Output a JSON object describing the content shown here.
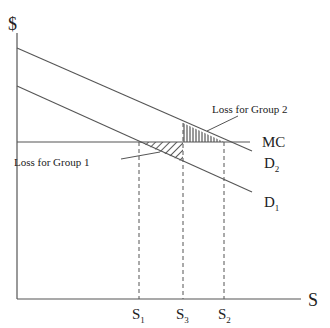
{
  "diagram": {
    "y_axis_label": "$",
    "x_axis_label": "S",
    "curves": {
      "mc_label": "MC",
      "d2_label": "D",
      "d2_sub": "2",
      "d1_label": "D",
      "d1_sub": "1"
    },
    "ticks": [
      {
        "base": "S",
        "sub": "1"
      },
      {
        "base": "S",
        "sub": "3"
      },
      {
        "base": "S",
        "sub": "2"
      }
    ],
    "annotations": {
      "loss_group_1": "Loss for Group 1",
      "loss_group_2": "Loss for Group 2"
    },
    "colors": {
      "line": "#555555",
      "text": "#222222",
      "background": "#ffffff"
    }
  }
}
